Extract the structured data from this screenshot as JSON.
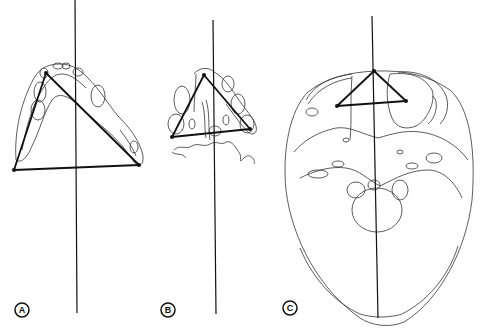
{
  "figure": {
    "panels": [
      {
        "label": "A",
        "subject": "mandible (lower jaw) top view with triangle"
      },
      {
        "label": "B",
        "subject": "maxillary/palatal view with triangle"
      },
      {
        "label": "C",
        "subject": "skull base (cranial floor) view with triangle"
      }
    ],
    "colors": {
      "line": "#333333",
      "axis": "#111111",
      "background": "#ffffff"
    }
  }
}
